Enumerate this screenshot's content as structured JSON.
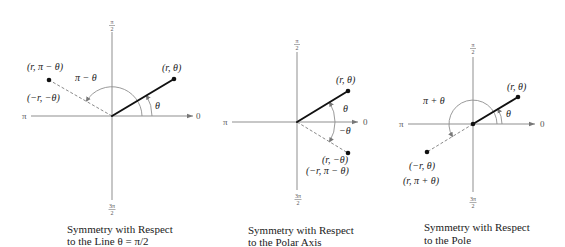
{
  "colors": {
    "axis": "#8f8f8f",
    "radius_line": "#111111",
    "label": "#222222"
  },
  "figures": [
    {
      "name": "Symmetry with Respect to the Line θ = π/2",
      "caption_line1": "Symmetry with Respect",
      "caption_line2": "to the Line θ = π/2",
      "axis_labels": {
        "top_num": "π",
        "top_den": "2",
        "bottom_num": "3π",
        "bottom_den": "2",
        "left": "π",
        "right": "0"
      },
      "point_original": "(r, θ)",
      "point_reflected": "(r, π − θ)",
      "point_reflected_alt": "(−r, −θ)",
      "angle_label": "θ",
      "angle_label_reflected": "π − θ"
    },
    {
      "name": "Symmetry with Respect to the Polar Axis",
      "caption_line1": "Symmetry with Respect",
      "caption_line2": "to the Polar Axis",
      "axis_labels": {
        "top_num": "π",
        "top_den": "2",
        "bottom_num": "3π",
        "bottom_den": "2",
        "left": "π",
        "right": "0"
      },
      "point_original": "(r, θ)",
      "point_reflected": "(r, −θ)",
      "point_reflected_alt": "(−r, π − θ)",
      "angle_label": "θ",
      "angle_label_reflected": "−θ"
    },
    {
      "name": "Symmetry with Respect to the Pole",
      "caption_line1": "Symmetry with Respect",
      "caption_line2": "to the Pole",
      "axis_labels": {
        "top_num": "π",
        "top_den": "2",
        "bottom_num": "3π",
        "bottom_den": "2",
        "left": "π",
        "right": "0"
      },
      "point_original": "(r, θ)",
      "point_reflected": "(−r, θ)",
      "point_reflected_alt": "(r, π + θ)",
      "angle_label": "θ",
      "angle_label_reflected": "π + θ"
    }
  ]
}
